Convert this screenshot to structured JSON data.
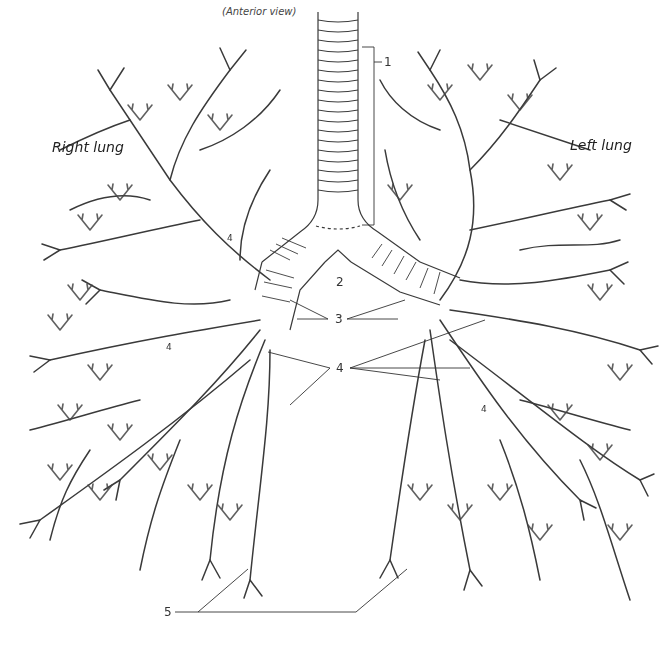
{
  "figure": {
    "view_label": "(Anterior view)",
    "right_lung_label": "Right lung",
    "left_lung_label": "Left lung"
  },
  "callouts": [
    {
      "id": "1",
      "label": "1",
      "target": "trachea"
    },
    {
      "id": "2",
      "label": "2",
      "target": "carina"
    },
    {
      "id": "3",
      "label": "3",
      "target": "main bronchi"
    },
    {
      "id": "4",
      "label": "4",
      "target": "lobar bronchi"
    },
    {
      "id": "5",
      "label": "5",
      "target": "bronchioles"
    }
  ],
  "inline_labels": [
    {
      "label": "4",
      "position": "right upper lobe"
    },
    {
      "label": "4",
      "position": "right middle"
    },
    {
      "label": "4",
      "position": "left lower lobe"
    }
  ],
  "colors": {
    "line": "#3a3a3a",
    "background": "#ffffff"
  }
}
